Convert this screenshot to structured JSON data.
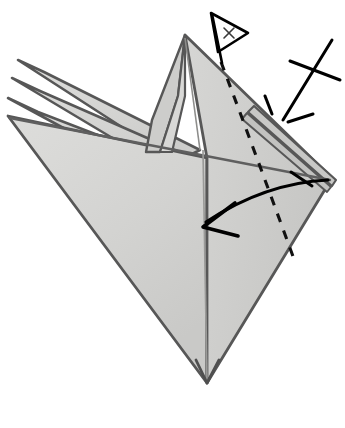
{
  "figure": {
    "kind": "line-art illustration",
    "caption_partial": "",
    "background_color": "#ffffff"
  },
  "palette": {
    "paper_fill": "#d2d2d0",
    "paper_fill_light": "#dcdcda",
    "paper_fill_shadow": "#c5c5c3",
    "paper_fill_deep": "#bdbdbb",
    "edge_stroke": "#575757",
    "crease_stroke": "#9a9a98",
    "annotation_stroke": "#000000",
    "caption_text": "#e9e9e9"
  },
  "shapes": {
    "main_body_label": "main folded sheet",
    "left_flaps_label": "stacked left flaps",
    "center_peak_label": "raised center peak",
    "right_layers_label": "right layered point",
    "bottom_point_label": "bottom vertex"
  },
  "annotations": {
    "fold_line": {
      "name": "valley-fold-dashed-line",
      "style": "dashed",
      "meaning": "fold along this line"
    },
    "fold_arrow": {
      "name": "fold-direction-arrow",
      "style": "curved arrow with open arrowhead",
      "meaning": "swing right point over to the left"
    },
    "pull_marker": {
      "name": "pull-out-x-marker",
      "style": "crossed lines radiating symbol",
      "meaning": "pull out / spread the layers here"
    },
    "flag_marker": {
      "name": "x-flag-pointer",
      "label": "x",
      "meaning": "point x reference marker"
    }
  },
  "geometry": {
    "body_outline": "185,35 332,178 207,383 8,116",
    "right_tip": "332,178",
    "top_peak": "185,35",
    "bottom_vertex": "207,383",
    "left_tip": "8,116"
  }
}
